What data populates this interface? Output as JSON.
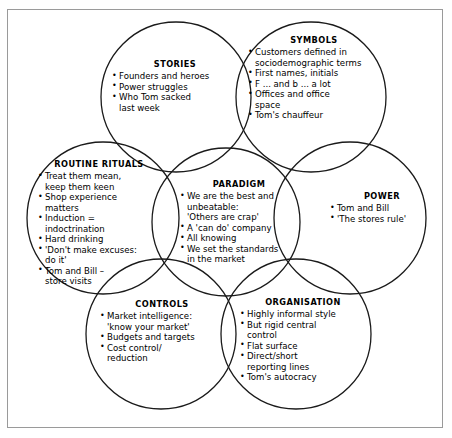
{
  "diagram": {
    "type": "venn-overlapping-circles",
    "stroke_color": "#1a1a1a",
    "frame_color": "#9a9a9a",
    "background_color": "#ffffff",
    "nodes": [
      {
        "id": "stories",
        "title": "STORIES",
        "items": [
          {
            "text": "Founders and heroes"
          },
          {
            "text": "Power struggles"
          },
          {
            "text": "Who Tom sacked",
            "cont": "last week"
          }
        ]
      },
      {
        "id": "symbols",
        "title": "SYMBOLS",
        "items": [
          {
            "text": "Customers defined in",
            "cont": "sociodemographic terms"
          },
          {
            "text": "First names, initials"
          },
          {
            "text": "F ... and b ... a lot"
          },
          {
            "text": "Offices and office",
            "cont": "space"
          },
          {
            "text": "Tom's chauffeur"
          }
        ]
      },
      {
        "id": "routine",
        "title": "ROUTINE RITUALS",
        "items": [
          {
            "text": "Treat them mean,",
            "cont": "keep them keen"
          },
          {
            "text": "Shop experience",
            "cont": "matters"
          },
          {
            "text": "Induction =",
            "cont": "indoctrination"
          },
          {
            "text": "Hard drinking"
          },
          {
            "text": "'Don't make excuses:",
            "cont": "do it'"
          },
          {
            "text": "Tom and Bill –",
            "cont": "store visits"
          }
        ]
      },
      {
        "id": "paradigm",
        "title": "PARADIGM",
        "items": [
          {
            "text": "We are the best and",
            "cont": "unbeatable:",
            "cont2": "'Others are crap'"
          },
          {
            "text": "A 'can do' company"
          },
          {
            "text": "All knowing"
          },
          {
            "text": "We set the standards",
            "cont": "in the market"
          }
        ]
      },
      {
        "id": "power",
        "title": "POWER",
        "items": [
          {
            "text": "Tom and Bill"
          },
          {
            "text": "'The stores rule'"
          }
        ]
      },
      {
        "id": "controls",
        "title": "CONTROLS",
        "items": [
          {
            "text": "Market intelligence:",
            "cont": "'know your market'"
          },
          {
            "text": "Budgets and targets"
          },
          {
            "text": "Cost control/",
            "cont": "reduction"
          }
        ]
      },
      {
        "id": "organisation",
        "title": "ORGANISATION",
        "items": [
          {
            "text": "Highly informal style"
          },
          {
            "text": "But rigid central",
            "cont": "control"
          },
          {
            "text": "Flat surface"
          },
          {
            "text": "Direct/short",
            "cont": "reporting lines"
          },
          {
            "text": "Tom's autocracy"
          }
        ]
      }
    ]
  }
}
